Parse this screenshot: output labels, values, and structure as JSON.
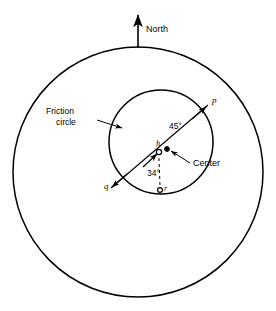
{
  "figure": {
    "type": "friction-circle-diagram",
    "background": "#ffffff",
    "stroke_color": "#000000"
  },
  "labels": {
    "north": "North",
    "friction_circle_line1": "Friction",
    "friction_circle_line2": "circle",
    "center": "Center",
    "angle_45": "45°",
    "angle_34": "34°",
    "point_p": "p",
    "point_q": "q",
    "point_h": "h",
    "point_r": "r"
  },
  "geometry": {
    "outer_circle": {
      "cx": 138,
      "cy": 172,
      "r": 125
    },
    "inner_circle": {
      "cx": 161,
      "cy": 142,
      "r": 52
    },
    "north_arrow": {
      "x": 138,
      "y_top": 13,
      "y_bottom": 48
    },
    "marker_h": {
      "cx": 159,
      "cy": 152,
      "style": "open-circle"
    },
    "marker_center": {
      "cx": 167,
      "cy": 149,
      "style": "filled-dot"
    },
    "marker_r": {
      "cx": 160,
      "cy": 190,
      "style": "open-circle"
    },
    "pq_line": {
      "x1": 111,
      "y1": 188,
      "x2": 208,
      "y2": 105,
      "angle_deg": 45
    },
    "dashed_line": {
      "x1": 159,
      "y1": 158,
      "x2": 160,
      "y2": 186
    }
  }
}
